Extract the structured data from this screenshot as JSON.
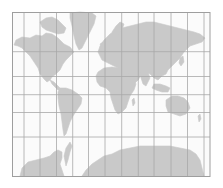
{
  "map": {
    "projection": "mercator",
    "colors": {
      "background": "#ffffff",
      "ocean": "#fbfbfb",
      "land": "#c9c9c9",
      "grid": "#a8a8a8",
      "border": "#9e9e9e"
    },
    "frame": {
      "x": 12.5,
      "y": 12.5,
      "width": 197.5,
      "height": 164
    },
    "grid": {
      "meridians_x": [
        24,
        40,
        56.5,
        72.7,
        88.5,
        105,
        121.7,
        138.3,
        154,
        171,
        187.5,
        204
      ],
      "parallels_y": [
        51.7,
        76.5,
        94.7,
        112.5,
        137
      ]
    },
    "landmasses": [
      {
        "name": "north-america",
        "points": "16,40 22,37 30,38 36,35 42,36 46,33 52,34 58,38 64,44 70,47 74,52 70,56 66,60 63,64 60,70 56,74 52,77 50,80 47,82 44,79 40,74 38,68 34,62 30,56 26,52 22,48 18,46 14,45"
      },
      {
        "name": "canadian-arctic-islands",
        "points": "40,22 46,18 52,17 58,20 62,24 66,28 64,33 58,34 52,32 46,30 42,27"
      },
      {
        "name": "greenland",
        "points": "70,13 80,12 92,13 96,16 94,24 90,32 86,40 82,48 79,50 76,44 74,36 72,26 70,18"
      },
      {
        "name": "central-america",
        "points": "50,80 54,82 57,85 60,88 61,90 58,90 55,87 52,84"
      },
      {
        "name": "south-america",
        "points": "60,88 66,88 72,90 78,94 82,98 81,104 77,110 73,116 70,122 68,128 66,134 64,136 63,130 62,122 61,114 59,106 58,98 58,92"
      },
      {
        "name": "europe-asia",
        "points": "100,46 104,40 110,34 116,30 122,28 130,26 138,24 146,22 154,22 162,24 170,26 178,28 186,30 194,32 200,34 205,38 202,42 196,44 190,46 184,52 180,58 176,62 172,66 168,70 166,74 162,76 158,80 154,78 150,74 146,72 142,74 138,80 134,84 130,80 126,74 122,70 118,68 114,66 110,64 106,62 102,60 100,56 98,52"
      },
      {
        "name": "scandinavia",
        "points": "112,32 116,26 120,22 124,24 122,30 118,36 114,38"
      },
      {
        "name": "british-isles",
        "points": "100,44 103,42 104,46 102,48"
      },
      {
        "name": "africa",
        "points": "98,72 104,68 112,67 120,68 126,70 130,74 134,80 136,84 134,90 130,96 128,102 126,108 122,112 118,114 115,110 113,104 111,98 110,92 106,88 100,86 97,82 96,76"
      },
      {
        "name": "madagascar",
        "points": "132,100 134,98 135,103 133,106"
      },
      {
        "name": "arabia",
        "points": "128,70 134,70 140,74 138,80 134,82 130,78"
      },
      {
        "name": "india",
        "points": "140,72 148,72 150,78 146,86 143,84 141,78"
      },
      {
        "name": "southeast-asia-islands",
        "points": "154,84 160,84 166,86 170,88 168,92 162,92 156,90 152,88"
      },
      {
        "name": "japan",
        "points": "180,58 183,56 184,62 181,66 179,63"
      },
      {
        "name": "australia",
        "points": "166,100 172,96 178,96 184,98 188,102 190,108 186,114 180,116 174,114 168,112 166,106"
      },
      {
        "name": "new-zealand",
        "points": "198,116 200,114 201,119 199,122"
      },
      {
        "name": "antarctica-west",
        "points": "20,176 22,168 28,162 36,160 44,158 50,156 54,152 58,150 62,152 62,158 60,164 62,170 64,176"
      },
      {
        "name": "antarctic-peninsula",
        "points": "64,156 66,148 70,142 72,146 70,152 68,160 66,166"
      },
      {
        "name": "antarctica-east",
        "points": "82,176 86,170 92,164 98,160 104,156 112,154 120,150 130,148 140,146 150,146 160,146 170,146 180,148 190,150 196,154 200,160 202,168 204,176"
      }
    ]
  }
}
